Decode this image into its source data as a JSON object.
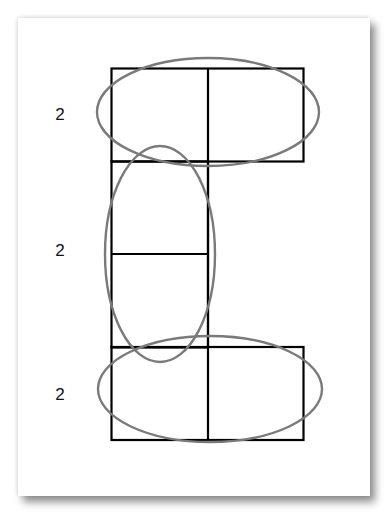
{
  "diagram": {
    "type": "grouping-diagram",
    "labels": [
      {
        "text": "2",
        "row": "top"
      },
      {
        "text": "2",
        "row": "middle"
      },
      {
        "text": "2",
        "row": "bottom"
      }
    ],
    "colors": {
      "grid_stroke": "#000000",
      "loop_stroke": "#7a7a7a",
      "background": "#ffffff"
    },
    "cells": [
      {
        "id": "top-left"
      },
      {
        "id": "top-right"
      },
      {
        "id": "middle-upper"
      },
      {
        "id": "middle-lower"
      },
      {
        "id": "bottom-left"
      },
      {
        "id": "bottom-right"
      }
    ],
    "loops": [
      {
        "id": "top-pair",
        "orientation": "horizontal"
      },
      {
        "id": "middle-pair",
        "orientation": "vertical"
      },
      {
        "id": "bottom-pair",
        "orientation": "horizontal"
      }
    ]
  }
}
